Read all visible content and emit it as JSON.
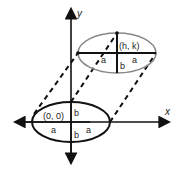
{
  "diagram": {
    "type": "ellipse-translation",
    "axes": {
      "x_label": "x",
      "y_label": "y"
    },
    "lower_ellipse": {
      "center_label": "(0, 0)",
      "a_label": "a",
      "b_label": "b",
      "stroke": "#111111"
    },
    "upper_ellipse": {
      "center_label": "(h, k)",
      "a_label": "a",
      "b_label": "b",
      "stroke": "#888888"
    },
    "translation_lines": {
      "style": "dashed",
      "count": 4
    }
  }
}
